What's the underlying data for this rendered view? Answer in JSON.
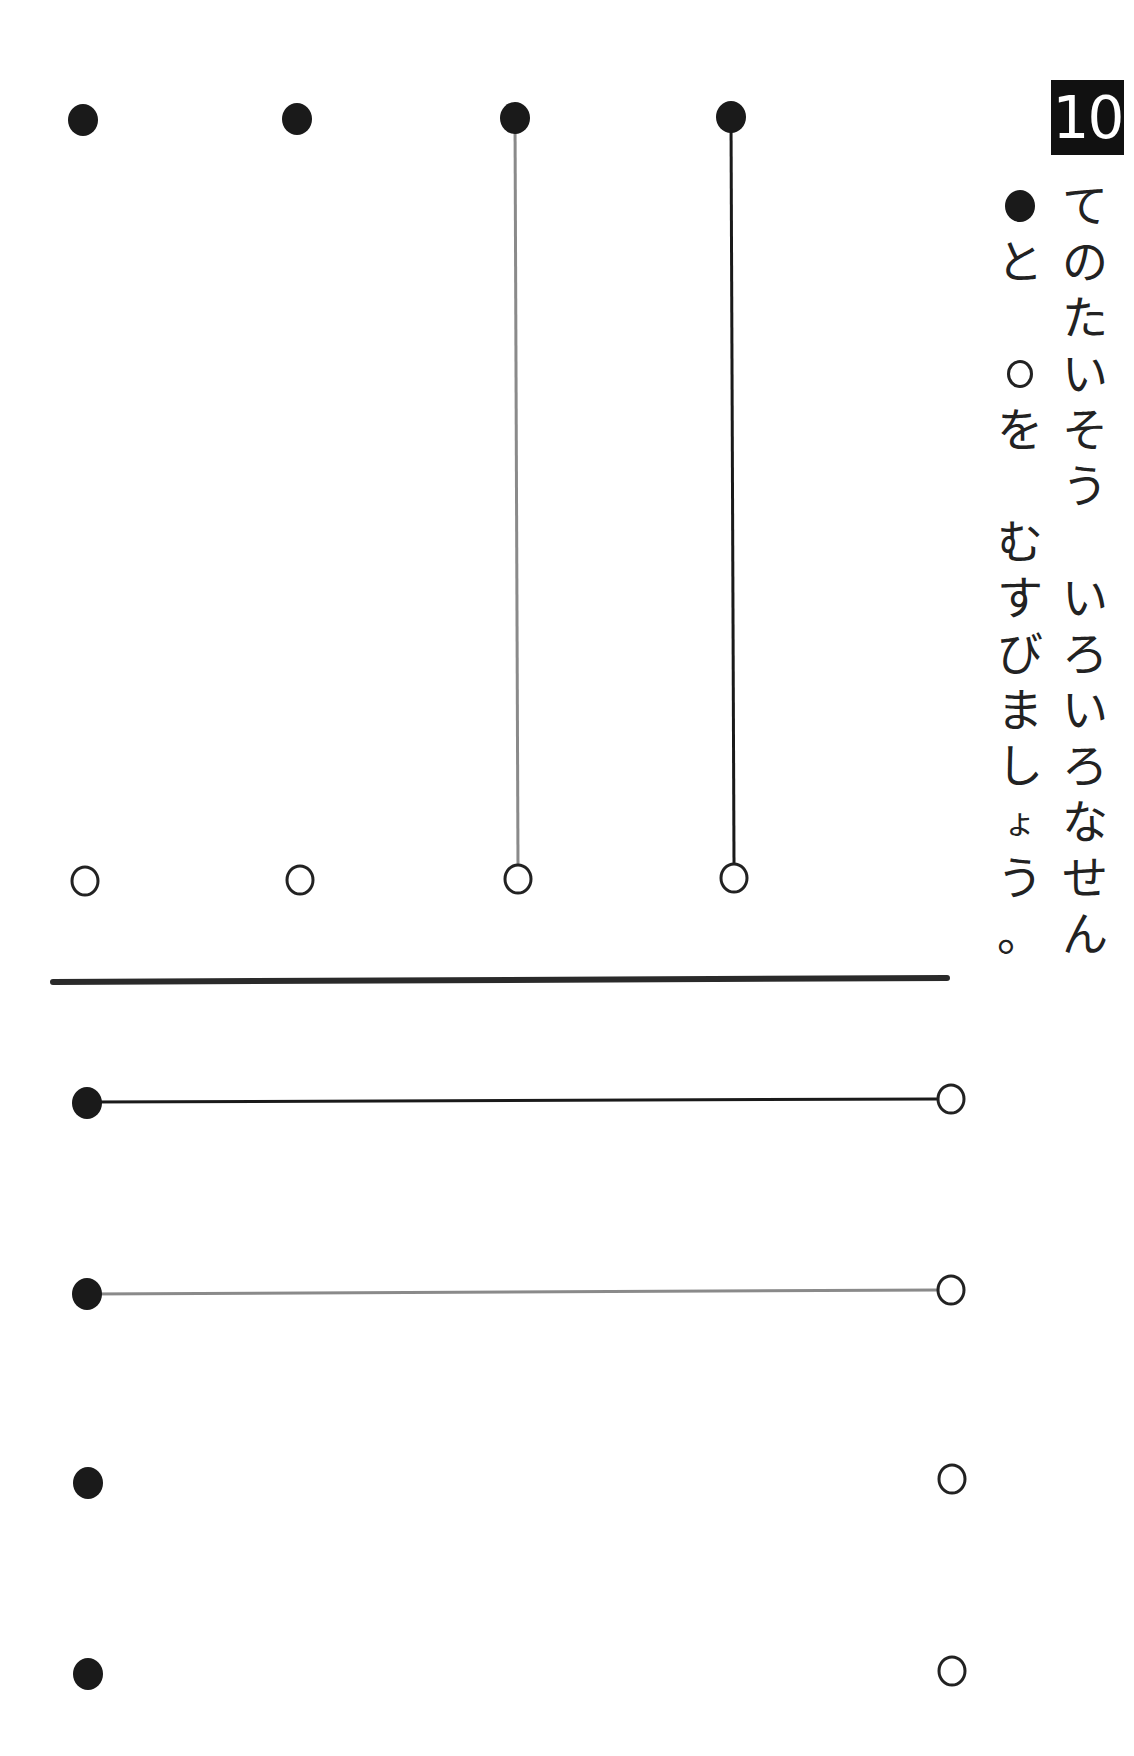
{
  "page": {
    "number": "10",
    "instruction": {
      "column_1": [
        "て",
        "の",
        "た",
        "い",
        "そ",
        "う",
        "",
        "い",
        "ろ",
        "い",
        "ろ",
        "な",
        "せ",
        "ん"
      ],
      "column_2_prefix_symbol": "filled-dot",
      "column_2_after_dot": [
        "と"
      ],
      "column_2_mid_symbol": "open-dot",
      "column_2_after_circle": [
        "を",
        "",
        "む",
        "す",
        "び",
        "ま",
        "し",
        "ょ",
        "う",
        "。"
      ],
      "full_text": "てのたいそう　いろいろなせん ●と○を むすびましょう。"
    }
  },
  "exercise_top": {
    "orientation": "vertical",
    "rows": [
      {
        "id": 1,
        "start": "filled-dot",
        "end": "open-dot",
        "line": "none"
      },
      {
        "id": 2,
        "start": "filled-dot",
        "end": "open-dot",
        "line": "none"
      },
      {
        "id": 3,
        "start": "filled-dot",
        "end": "open-dot",
        "line": "gray",
        "line_color": "#8a8a8a"
      },
      {
        "id": 4,
        "start": "filled-dot",
        "end": "open-dot",
        "line": "black",
        "line_color": "#1a1a1a"
      }
    ]
  },
  "exercise_bottom": {
    "orientation": "horizontal",
    "rows": [
      {
        "id": 1,
        "start": "filled-dot",
        "end": "open-dot",
        "line": "black",
        "line_color": "#1a1a1a"
      },
      {
        "id": 2,
        "start": "filled-dot",
        "end": "open-dot",
        "line": "gray",
        "line_color": "#8a8a8a"
      },
      {
        "id": 3,
        "start": "filled-dot",
        "end": "open-dot",
        "line": "none"
      },
      {
        "id": 4,
        "start": "filled-dot",
        "end": "open-dot",
        "line": "none"
      }
    ]
  },
  "colors": {
    "ink": "#1a1a1a",
    "trace_gray": "#8a8a8a",
    "divider": "#2a2a2a",
    "paper": "#ffffff"
  }
}
